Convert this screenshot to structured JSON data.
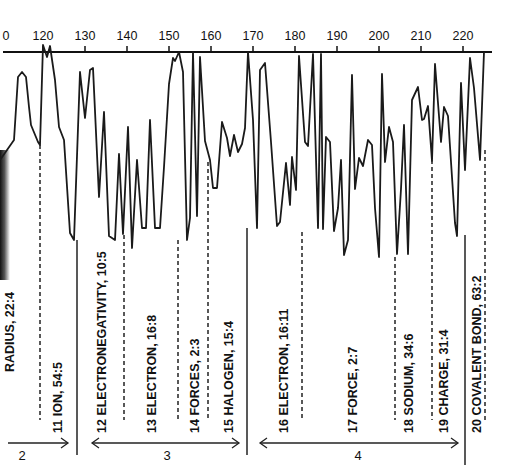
{
  "chart_data": {
    "type": "line",
    "title": "",
    "xlabel": "",
    "ylabel": "",
    "orientation": "x axis on top, values plotted downward",
    "xlim": [
      110,
      225
    ],
    "x_ticks": [
      "0",
      "120",
      "130",
      "140",
      "150",
      "160",
      "170",
      "180",
      "190",
      "200",
      "210",
      "220"
    ],
    "grid": false,
    "series": [
      {
        "name": "trace",
        "points_px": [
          [
            0,
            160
          ],
          [
            7,
            150
          ],
          [
            14,
            140
          ],
          [
            18,
            77
          ],
          [
            22,
            72
          ],
          [
            26,
            77
          ],
          [
            29,
            107
          ],
          [
            31,
            125
          ],
          [
            38,
            142
          ],
          [
            40,
            145
          ],
          [
            43,
            45
          ],
          [
            47,
            57
          ],
          [
            50,
            46
          ],
          [
            55,
            80
          ],
          [
            59,
            127
          ],
          [
            64,
            140
          ],
          [
            70,
            233
          ],
          [
            74,
            240
          ],
          [
            80,
            72
          ],
          [
            85,
            118
          ],
          [
            90,
            70
          ],
          [
            93,
            68
          ],
          [
            99,
            197
          ],
          [
            104,
            112
          ],
          [
            109,
            236
          ],
          [
            115,
            240
          ],
          [
            119,
            154
          ],
          [
            123,
            234
          ],
          [
            128,
            127
          ],
          [
            132,
            248
          ],
          [
            137,
            160
          ],
          [
            142,
            228
          ],
          [
            146,
            228
          ],
          [
            150,
            120
          ],
          [
            155,
            228
          ],
          [
            160,
            228
          ],
          [
            164,
            167
          ],
          [
            169,
            84
          ],
          [
            173,
            58
          ],
          [
            175,
            61
          ],
          [
            179,
            52
          ],
          [
            183,
            72
          ],
          [
            187,
            240
          ],
          [
            190,
            218
          ],
          [
            193,
            52
          ],
          [
            197,
            216
          ],
          [
            200,
            57
          ],
          [
            205,
            141
          ],
          [
            210,
            160
          ],
          [
            213,
            188
          ],
          [
            217,
            188
          ],
          [
            222,
            122
          ],
          [
            227,
            138
          ],
          [
            230,
            156
          ],
          [
            234,
            135
          ],
          [
            238,
            152
          ],
          [
            242,
            144
          ],
          [
            245,
            128
          ],
          [
            248,
            52
          ],
          [
            253,
            120
          ],
          [
            257,
            228
          ],
          [
            260,
            70
          ],
          [
            265,
            63
          ],
          [
            271,
            142
          ],
          [
            277,
            226
          ],
          [
            280,
            222
          ],
          [
            286,
            163
          ],
          [
            290,
            205
          ],
          [
            292,
            157
          ],
          [
            296,
            190
          ],
          [
            299,
            56
          ],
          [
            305,
            142
          ],
          [
            308,
            146
          ],
          [
            313,
            54
          ],
          [
            318,
            228
          ],
          [
            321,
            54
          ],
          [
            323,
            229
          ],
          [
            326,
            137
          ],
          [
            330,
            142
          ],
          [
            334,
            231
          ],
          [
            338,
            208
          ],
          [
            341,
            160
          ],
          [
            344,
            255
          ],
          [
            348,
            240
          ],
          [
            352,
            75
          ],
          [
            355,
            189
          ],
          [
            359,
            158
          ],
          [
            363,
            166
          ],
          [
            368,
            140
          ],
          [
            372,
            145
          ],
          [
            375,
            208
          ],
          [
            379,
            257
          ],
          [
            382,
            74
          ],
          [
            385,
            162
          ],
          [
            389,
            127
          ],
          [
            393,
            142
          ],
          [
            397,
            254
          ],
          [
            401,
            189
          ],
          [
            404,
            125
          ],
          [
            408,
            254
          ],
          [
            412,
            100
          ],
          [
            418,
            87
          ],
          [
            422,
            120
          ],
          [
            424,
            119
          ],
          [
            428,
            106
          ],
          [
            432,
            161
          ],
          [
            435,
            64
          ],
          [
            441,
            142
          ],
          [
            444,
            107
          ],
          [
            448,
            116
          ],
          [
            455,
            223
          ],
          [
            457,
            236
          ],
          [
            461,
            83
          ],
          [
            465,
            170
          ],
          [
            470,
            58
          ],
          [
            474,
            88
          ],
          [
            480,
            160
          ],
          [
            484,
            52
          ]
        ]
      }
    ],
    "segments": [
      {
        "number": "11",
        "label": "ION, 54:5"
      },
      {
        "number": "12",
        "label": "ELECTRONEGATIVITY, 10:5"
      },
      {
        "number": "13",
        "label": "ELECTRON, 16:8"
      },
      {
        "number": "14",
        "label": "FORCES, 2:3"
      },
      {
        "number": "15",
        "label": "HALOGEN, 15:4"
      },
      {
        "number": "16",
        "label": "ELECTRON, 16:11"
      },
      {
        "number": "17",
        "label": "FORCE, 2:7"
      },
      {
        "number": "18",
        "label": "SODIUM, 34:6"
      },
      {
        "number": "19",
        "label": "CHARGE, 31:4"
      },
      {
        "number": "20",
        "label": "COVALENT BOND, 63:2"
      }
    ],
    "partial_segment_label": "RADIUS, 22:4",
    "sections": [
      {
        "label": "2",
        "range": "through segment 11"
      },
      {
        "label": "3",
        "range": "segments 12-15"
      },
      {
        "label": "4",
        "range": "segments 16-19"
      }
    ],
    "colors": {
      "line": "#1a1a1a",
      "background": "#ffffff"
    }
  }
}
